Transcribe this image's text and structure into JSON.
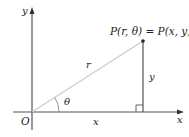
{
  "diagram": {
    "point_label": "P(r, θ) = P(x, y)",
    "origin_label": "O",
    "x_axis_label": "x",
    "y_axis_label": "y",
    "hypotenuse_label": "r",
    "angle_label": "θ",
    "horizontal_leg_label": "x",
    "vertical_leg_label": "y",
    "colors": {
      "axis": "#333333",
      "radius_line": "#c8c8c8",
      "leg": "#555555",
      "text": "#222222"
    }
  }
}
